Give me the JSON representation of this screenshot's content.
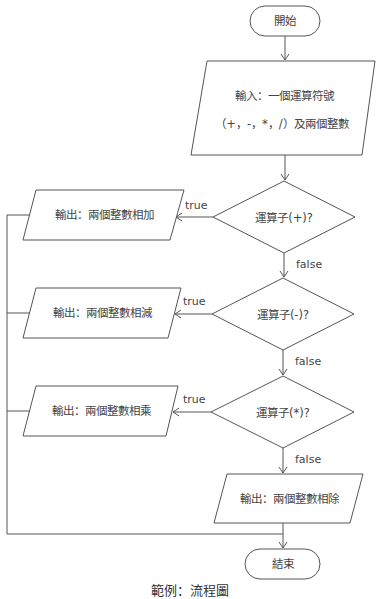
{
  "diagram": {
    "type": "flowchart",
    "nodes": {
      "start": {
        "kind": "terminal",
        "label": "開始"
      },
      "input": {
        "kind": "io",
        "line1": "輸入：一個運算符號",
        "line2": "（+，-，*，/）及兩個整數"
      },
      "dec_add": {
        "kind": "decision",
        "label": "運算子(+)?"
      },
      "dec_sub": {
        "kind": "decision",
        "label": "運算子(-)?"
      },
      "dec_mul": {
        "kind": "decision",
        "label": "運算子(*)?"
      },
      "out_add": {
        "kind": "io",
        "label": "輸出：兩個整數相加"
      },
      "out_sub": {
        "kind": "io",
        "label": "輸出：兩個整數相減"
      },
      "out_mul": {
        "kind": "io",
        "label": "輸出：兩個整數相乘"
      },
      "out_div": {
        "kind": "io",
        "label": "輸出：兩個整數相除"
      },
      "end": {
        "kind": "terminal",
        "label": "結束"
      }
    },
    "edges": [
      {
        "from": "start",
        "to": "input"
      },
      {
        "from": "input",
        "to": "dec_add"
      },
      {
        "from": "dec_add",
        "to": "out_add",
        "label": "true"
      },
      {
        "from": "dec_add",
        "to": "dec_sub",
        "label": "false"
      },
      {
        "from": "dec_sub",
        "to": "out_sub",
        "label": "true"
      },
      {
        "from": "dec_sub",
        "to": "dec_mul",
        "label": "false"
      },
      {
        "from": "dec_mul",
        "to": "out_mul",
        "label": "true"
      },
      {
        "from": "dec_mul",
        "to": "out_div",
        "label": "false"
      },
      {
        "from": "out_add",
        "to": "end"
      },
      {
        "from": "out_sub",
        "to": "end"
      },
      {
        "from": "out_mul",
        "to": "end"
      },
      {
        "from": "out_div",
        "to": "end"
      }
    ],
    "edge_labels": {
      "true": "true",
      "false": "false"
    },
    "caption": "範例：流程圖"
  }
}
